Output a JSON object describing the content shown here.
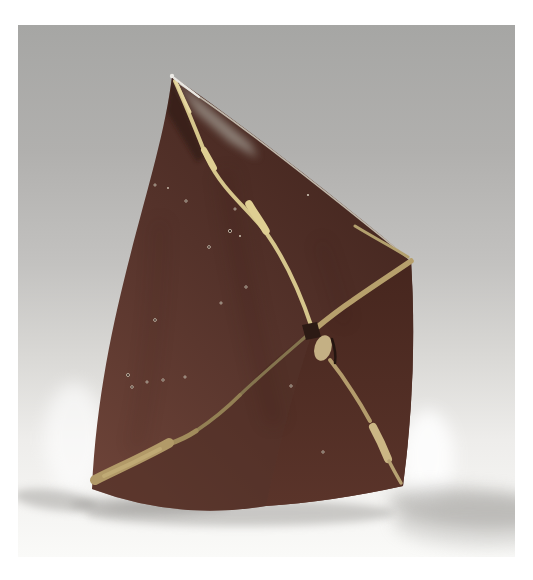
{
  "image": {
    "type": "studio photograph",
    "description": "Studio photograph of an abstract angular ceramic sculpture: a dark red-brown folded pyramid form with a sharp apex, crossed by pale ochre glaze lines that intersect in an X near the lower right, standing on a seamless gray backdrop that fades to a white floor with soft shadows on both sides.",
    "subject": "abstract folded-pyramid ceramic sculpture",
    "background": "seamless gray-to-white studio gradient backdrop",
    "lighting": "soft light from upper right; bright rim light at the lower edges; soft floor shadows cast left and right"
  },
  "sculpture": {
    "form": "asymmetric folded pyramid with a sharp apex at top and a wide base",
    "surface": "matte dark red-brown glaze with tiny speckle pits",
    "line_motif": "two pale ochre glaze lines running corner-to-corner and crossing in an X below center-right",
    "features": [
      "thin pale highlight along the curved top-right ridge",
      "small dark patch and pale knot at the line crossing",
      "thick tan stripe ending at the bottom-left corner",
      "pale blob on the line near the bottom-right corner",
      "scattered glaze speckles on the front face"
    ]
  },
  "colors": {
    "page_bg": "#ffffff",
    "backdrop": {
      "s0": "#a6a6a4",
      "s1": "#b1b0ae",
      "s2": "#c3c2c0",
      "s3": "#d9d8d5",
      "s4": "#eeedeb",
      "s5": "#fafaf8"
    },
    "faces": {
      "main_dark": "#40231c",
      "main_mid": "#54322a",
      "main_light": "#6c4338",
      "right_top": "#46261e",
      "right_bottom": "#5a342a",
      "bottom_wedge": "#4e2d24",
      "shade_strip": "#331c16",
      "specular": "#9f978e",
      "streak": "#381f18"
    },
    "lines": {
      "pale": "#d6c68c",
      "pale_bright": "#e6d7a0",
      "blob": "#dfcf93",
      "tan": "#b7a06c",
      "olive": "#84744e",
      "olive_mid": "#938054",
      "olive_light": "#a28c5c",
      "thick": "#b29a68",
      "thick_core": "#c2ad78",
      "lower": "#b49c6c",
      "lower_blob": "#cbb684",
      "lower_tail": "#b7a172",
      "ridge": "#c6bfb2",
      "ridge_bright": "#e9e7e2",
      "ridge_tan": "#b3a06e",
      "knot": "#c4b084",
      "cross_dark": "#2c1a14",
      "accent_dark": "#241510"
    },
    "speckles": {
      "dark": "#2a1914",
      "rim": "#d8cdbd",
      "bright": "#cfc4b4"
    },
    "shadow_soft": "#9d9b98",
    "shadow_core": "#8f8d8a",
    "glow": "#ffffff",
    "apex_tip": "#eceae6"
  }
}
